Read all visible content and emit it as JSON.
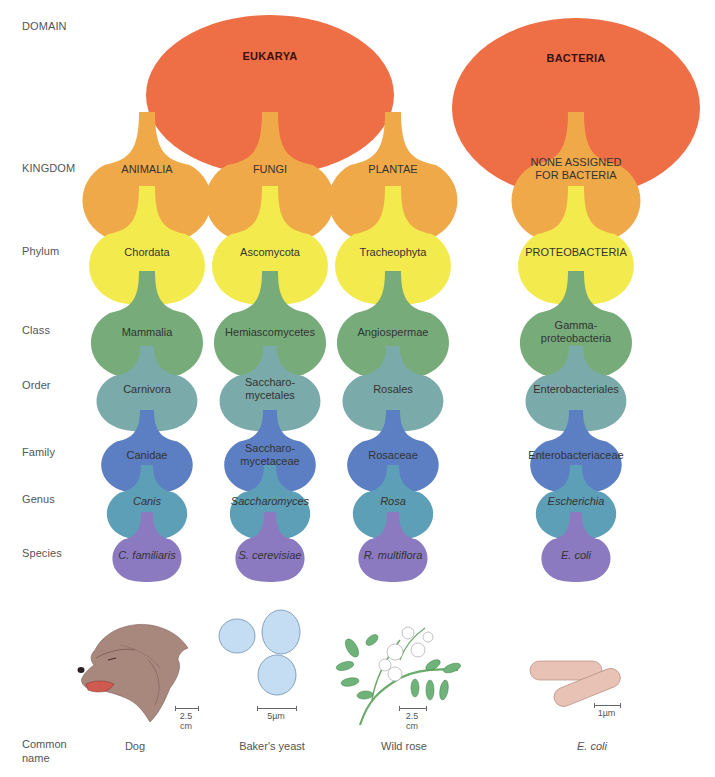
{
  "rank_labels": [
    {
      "id": "domain",
      "text": "DOMAIN",
      "y": 20
    },
    {
      "id": "kingdom",
      "text": "KINGDOM",
      "y": 162
    },
    {
      "id": "phylum",
      "text": "Phylum",
      "y": 245
    },
    {
      "id": "class",
      "text": "Class",
      "y": 324
    },
    {
      "id": "order",
      "text": "Order",
      "y": 379
    },
    {
      "id": "family",
      "text": "Family",
      "y": 446
    },
    {
      "id": "genus",
      "text": "Genus",
      "y": 493
    },
    {
      "id": "species",
      "text": "Species",
      "y": 547
    }
  ],
  "colors": {
    "domain": "#ee6e45",
    "kingdom": "#f0a948",
    "phylum": "#f3ea4e",
    "class": "#77ab7a",
    "order": "#7aabaa",
    "family": "#5b7fc2",
    "genus": "#5e9fb8",
    "species": "#8b7ac0"
  },
  "domains": [
    {
      "label": "EUKARYA",
      "cx": 270,
      "cy": 95,
      "rx": 124,
      "ry": 80,
      "text_y": 56
    },
    {
      "label": "BACTERIA",
      "cx": 576,
      "cy": 108,
      "rx": 124,
      "ry": 90,
      "text_y": 58
    }
  ],
  "columns": [
    {
      "cx": 147,
      "kingdom": "ANIMALIA",
      "phylum": "Chordata",
      "class": "Mammalia",
      "order": "Carnivora",
      "family": "Canidae",
      "genus": "Canis",
      "species": "C. familiaris",
      "common_name": "Dog",
      "scale": "2.5 cm"
    },
    {
      "cx": 270,
      "kingdom": "FUNGI",
      "phylum": "Ascomycota",
      "class": "Hemiascomycetes",
      "order": "Saccharo-\nmycetales",
      "family": "Saccharo-\nmycetaceae",
      "genus": "Saccharomyces",
      "species": "S. cerevisiae",
      "common_name": "Baker's yeast",
      "scale": "5µm"
    },
    {
      "cx": 393,
      "kingdom": "PLANTAE",
      "phylum": "Tracheophyta",
      "class": "Angiospermae",
      "order": "Rosales",
      "family": "Rosaceae",
      "genus": "Rosa",
      "species": "R. multiflora",
      "common_name": "Wild rose",
      "scale": "2.5 cm"
    },
    {
      "cx": 576,
      "kingdom": "NONE ASSIGNED\nFOR BACTERIA",
      "phylum": "PROTEOBACTERIA",
      "class": "Gamma-\nproteobacteria",
      "order": "Enterobacteriales",
      "family": "Enterobacteriaceae",
      "genus": "Escherichia",
      "species": "E. coli",
      "common_name": "E. coli",
      "scale": "1µm"
    }
  ],
  "layers": [
    {
      "rank": "kingdom",
      "top": 112,
      "neck_top": 112,
      "body_cy": 196,
      "rx": 69,
      "ry": 50,
      "neck_w": 8,
      "text_y": 169,
      "italic": false
    },
    {
      "rank": "phylum",
      "top": 186,
      "neck_top": 186,
      "body_cy": 262,
      "rx": 62,
      "ry": 45,
      "neck_w": 8,
      "text_y": 252,
      "italic": false
    },
    {
      "rank": "class",
      "top": 271,
      "neck_top": 271,
      "body_cy": 339,
      "rx": 60,
      "ry": 42,
      "neck_w": 8,
      "text_y": 332,
      "italic": false
    },
    {
      "rank": "order",
      "top": 346,
      "neck_top": 346,
      "body_cy": 398,
      "rx": 54,
      "ry": 35,
      "neck_w": 7,
      "text_y": 389,
      "italic": false
    },
    {
      "rank": "family",
      "top": 410,
      "neck_top": 410,
      "body_cy": 462,
      "rx": 49,
      "ry": 33,
      "neck_w": 7,
      "text_y": 455,
      "italic": false
    },
    {
      "rank": "genus",
      "top": 465,
      "neck_top": 465,
      "body_cy": 511,
      "rx": 43,
      "ry": 30,
      "neck_w": 6,
      "text_y": 501,
      "italic": true
    },
    {
      "rank": "species",
      "top": 512,
      "neck_top": 512,
      "body_cy": 556,
      "rx": 37,
      "ry": 27,
      "neck_w": 6,
      "text_y": 555,
      "italic": true
    }
  ],
  "common_name_label": "Common\nname",
  "common_name_y": 740
}
